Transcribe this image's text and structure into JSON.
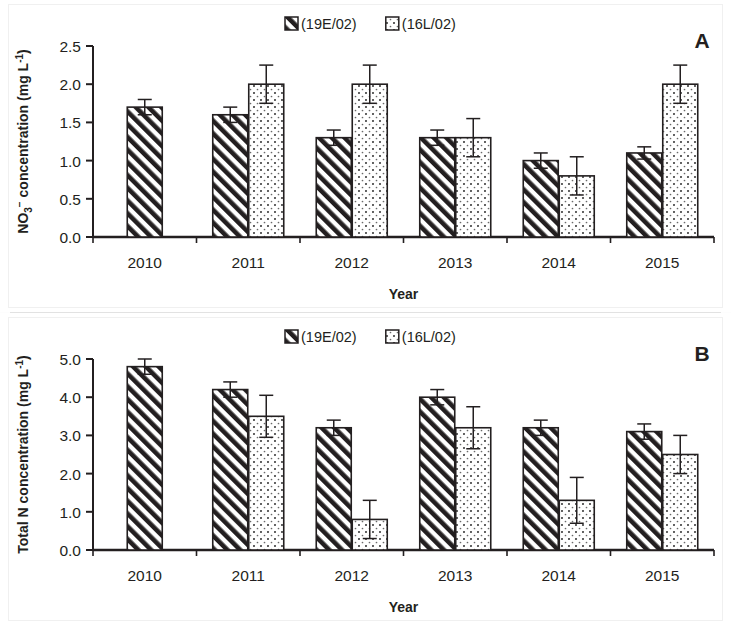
{
  "figure": {
    "background_color": "#ffffff",
    "ink_color": "#231f20",
    "divider_color": "#e2e2e2"
  },
  "panels": [
    {
      "letter": "A",
      "ylabel_main": "NO",
      "ylabel_sub": "3",
      "ylabel_sup": "−",
      "ylabel_rest": " concentration (mg L",
      "ylabel_unit_sup": "-1",
      "ylabel_close": ")",
      "ylabel_full": "NO3- concentration (mg L-1)",
      "xlabel": "Year",
      "legend": [
        {
          "label": "(19E/02)",
          "pattern": "diagonal-hatch"
        },
        {
          "label": "(16L/02)",
          "pattern": "dotted"
        }
      ],
      "ticks": [
        "0.0",
        "0.5",
        "1.0",
        "1.5",
        "2.0",
        "2.5"
      ]
    },
    {
      "letter": "B",
      "ylabel_main": "Total N concentration (mg L",
      "ylabel_unit_sup": "-1",
      "ylabel_close": ")",
      "ylabel_full": "Total N concentration (mg L-1)",
      "xlabel": "Year",
      "legend": [
        {
          "label": "(19E/02)",
          "pattern": "diagonal-hatch"
        },
        {
          "label": "(16L/02)",
          "pattern": "dotted"
        }
      ],
      "ticks": [
        "0.0",
        "1.0",
        "2.0",
        "3.0",
        "4.0",
        "5.0"
      ]
    }
  ],
  "chart_data": [
    {
      "type": "bar",
      "title": "",
      "panel": "A",
      "xlabel": "Year",
      "ylabel": "NO3- concentration (mg L-1)",
      "categories": [
        "2010",
        "2011",
        "2012",
        "2013",
        "2014",
        "2015"
      ],
      "ylim": [
        0.0,
        2.5
      ],
      "ytick_step": 0.5,
      "yticks": [
        0.0,
        0.5,
        1.0,
        1.5,
        2.0,
        2.5
      ],
      "grid": false,
      "legend_position": "top-center",
      "series": [
        {
          "name": "(19E/02)",
          "pattern": "diagonal-hatch",
          "values": [
            1.7,
            1.6,
            1.3,
            1.3,
            1.0,
            1.1
          ],
          "errors": [
            0.1,
            0.1,
            0.1,
            0.1,
            0.1,
            0.08
          ]
        },
        {
          "name": "(16L/02)",
          "pattern": "dotted",
          "values": [
            null,
            2.0,
            2.0,
            1.3,
            0.8,
            2.0
          ],
          "errors": [
            null,
            0.25,
            0.25,
            0.25,
            0.25,
            0.25
          ]
        }
      ]
    },
    {
      "type": "bar",
      "title": "",
      "panel": "B",
      "xlabel": "Year",
      "ylabel": "Total N concentration (mg L-1)",
      "categories": [
        "2010",
        "2011",
        "2012",
        "2013",
        "2014",
        "2015"
      ],
      "ylim": [
        0.0,
        5.0
      ],
      "ytick_step": 1.0,
      "yticks": [
        0.0,
        1.0,
        2.0,
        3.0,
        4.0,
        5.0
      ],
      "grid": false,
      "legend_position": "top-center",
      "series": [
        {
          "name": "(19E/02)",
          "pattern": "diagonal-hatch",
          "values": [
            4.8,
            4.2,
            3.2,
            4.0,
            3.2,
            3.1
          ],
          "errors": [
            0.2,
            0.2,
            0.2,
            0.2,
            0.2,
            0.2
          ]
        },
        {
          "name": "(16L/02)",
          "pattern": "dotted",
          "values": [
            null,
            3.5,
            0.8,
            3.2,
            1.3,
            2.5
          ],
          "errors": [
            null,
            0.55,
            0.5,
            0.55,
            0.6,
            0.5
          ]
        }
      ]
    }
  ]
}
